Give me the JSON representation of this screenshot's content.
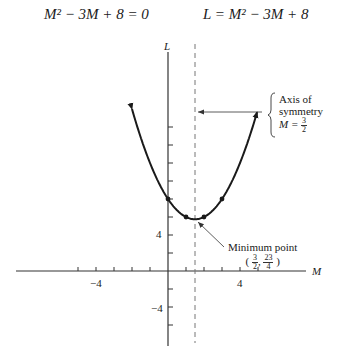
{
  "equations": {
    "left": "M² − 3M + 8 = 0",
    "right": "L = M² − 3M + 8"
  },
  "axes": {
    "y_label": "L",
    "x_label": "M",
    "x_tick_labels": [
      {
        "value": -4,
        "text": "−4"
      },
      {
        "value": 4,
        "text": "4"
      }
    ],
    "y_tick_labels": [
      {
        "value": 4,
        "text": "4"
      },
      {
        "value": -4,
        "text": "−4"
      }
    ]
  },
  "annotations": {
    "axis_of_symmetry": {
      "line1": "Axis of",
      "line2": "symmetry",
      "eq_prefix": "M = ",
      "frac_num": "3",
      "frac_den": "2"
    },
    "minimum_point": {
      "title": "Minimum point",
      "open": "(",
      "x_num": "3",
      "x_den": "2",
      "sep": ",",
      "y_num": "23",
      "y_den": "4",
      "close": ")"
    }
  },
  "colors": {
    "curve": "#1a1a1a",
    "axes": "#333333",
    "dashed": "#777777"
  },
  "chart_data": {
    "type": "line",
    "title": "L = M² − 3M + 8",
    "xlabel": "M",
    "ylabel": "L",
    "xlim": [
      -8.5,
      9
    ],
    "ylim": [
      -6,
      24
    ],
    "x_tick_step": 1,
    "y_tick_step": 2,
    "series": [
      {
        "name": "L = M² − 3M + 8",
        "x": [
          -2,
          -1,
          0,
          1,
          1.5,
          2,
          3,
          4,
          5
        ],
        "values": [
          18,
          12,
          8,
          6,
          5.75,
          6,
          8,
          12,
          18
        ]
      }
    ],
    "marked_points": [
      {
        "x": 0,
        "y": 8
      },
      {
        "x": 1,
        "y": 6
      },
      {
        "x": 2,
        "y": 6
      },
      {
        "x": 3,
        "y": 8
      }
    ],
    "vertex": {
      "x": 1.5,
      "y": 5.75
    },
    "axis_of_symmetry": 1.5,
    "grid": false,
    "legend": "none"
  }
}
